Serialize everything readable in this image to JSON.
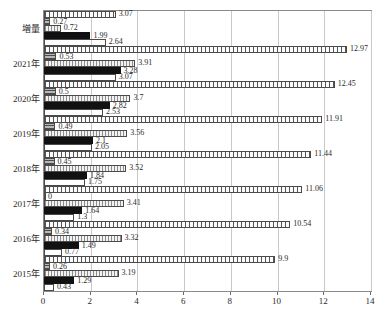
{
  "chart_data": {
    "type": "bar",
    "orientation": "horizontal",
    "title": "",
    "xlabel": "",
    "ylabel": "",
    "xlim": [
      0,
      14
    ],
    "xticks": [
      0,
      2,
      4,
      6,
      8,
      10,
      12,
      14
    ],
    "xticklabels": [
      "0",
      "2",
      "4",
      "6",
      "8",
      "10",
      "12",
      "14"
    ],
    "grid": true,
    "legend": null,
    "categories": [
      "増量",
      "2021年",
      "2020年",
      "2019年",
      "2018年",
      "2017年",
      "2016年",
      "2015年"
    ],
    "series": [
      {
        "name": "series-1",
        "pattern": "vertical-grid-hatch",
        "values": [
          3.07,
          12.97,
          12.45,
          11.91,
          11.44,
          11.06,
          10.54,
          9.9
        ],
        "labels": [
          "3.07",
          "12.97",
          "12.45",
          "11.91",
          "11.44",
          "11.06",
          "10.54",
          "9.9"
        ]
      },
      {
        "name": "series-2",
        "pattern": "gray-horizontal-lines",
        "values": [
          0.27,
          0.53,
          0.5,
          0.49,
          0.45,
          0.0,
          0.34,
          0.26
        ],
        "labels": [
          "0.27",
          "0.53",
          "0.5",
          "0.49",
          "0.45",
          "0",
          "0.34",
          "0.26"
        ]
      },
      {
        "name": "series-3",
        "pattern": "light-dotted-hatch",
        "values": [
          0.72,
          3.91,
          3.7,
          3.56,
          3.52,
          3.41,
          3.32,
          3.19
        ],
        "labels": [
          "0.72",
          "3.91",
          "3.7",
          "3.56",
          "3.52",
          "3.41",
          "3.32",
          "3.19"
        ]
      },
      {
        "name": "series-4",
        "pattern": "fine-hatch",
        "values": [
          1.99,
          3.28,
          2.82,
          2.1,
          1.84,
          1.64,
          1.49,
          1.29
        ],
        "labels": [
          "1.99",
          "3.28",
          "2.82",
          "2.1",
          "1.84",
          "1.64",
          "1.49",
          "1.29"
        ]
      },
      {
        "name": "series-5",
        "pattern": "solid-black",
        "values": [
          2.64,
          3.07,
          2.53,
          2.05,
          1.75,
          1.3,
          0.77,
          0.43
        ],
        "labels": [
          "2.64",
          "3.07",
          "2.53",
          "2.05",
          "1.75",
          "1.3",
          "0.77",
          "0.43"
        ]
      }
    ]
  }
}
